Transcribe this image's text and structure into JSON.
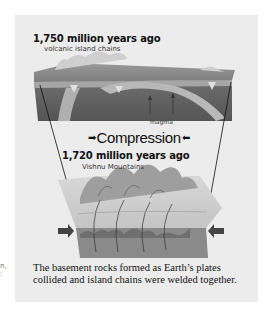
{
  "figure": {
    "stage1": {
      "title": "1,750 million years ago",
      "subtitle": "volcanic island chains",
      "label_magma": "magma"
    },
    "process_label": "Compression",
    "process_arrow_left": "➡",
    "process_arrow_right": "⬅",
    "stage2": {
      "title": "1,720 million years ago",
      "subtitle": "Vishnu Mountains"
    },
    "caption_line1": "The basement rocks formed as Earth’s plates",
    "caption_line2": "collided and island chains were welded together.",
    "margin_fragment_line1": "n,",
    "margin_fragment_line2": ":"
  }
}
